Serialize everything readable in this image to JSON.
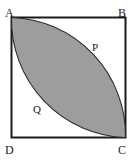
{
  "figure": {
    "type": "geometry-diagram",
    "background_color": "#ffffff",
    "square": {
      "name": "square-ABCD",
      "stroke_color": "#1a1a1a",
      "fill_color": "#ffffff",
      "stroke_width": 2,
      "x": 11,
      "y": 17,
      "width": 115,
      "height": 121
    },
    "lens": {
      "name": "shaded-lens",
      "fill_color": "#9d9d9d",
      "stroke_color": "#2b2b2b",
      "stroke_width": 1,
      "arc_endpoint_start": "A",
      "arc_endpoint_end": "C",
      "arc_1_center": "B",
      "arc_2_center": "D"
    },
    "vertex_labels": [
      {
        "id": "A",
        "text": "A",
        "position": "top-left"
      },
      {
        "id": "B",
        "text": "B",
        "position": "top-right"
      },
      {
        "id": "C",
        "text": "C",
        "position": "bottom-right"
      },
      {
        "id": "D",
        "text": "D",
        "position": "bottom-left"
      }
    ],
    "region_labels": [
      {
        "id": "P",
        "text": "P",
        "position": "upper-right-white-region"
      },
      {
        "id": "Q",
        "text": "Q",
        "position": "lower-left-white-region"
      }
    ]
  }
}
